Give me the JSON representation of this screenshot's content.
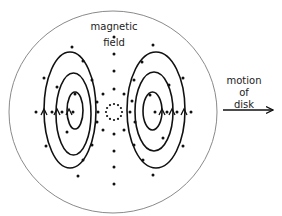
{
  "diagram": {
    "labels": {
      "field_line1": "magnetic",
      "field_line2": "field",
      "motion_line1": "motion",
      "motion_line2": "of",
      "motion_line3": "disk"
    },
    "colors": {
      "disk_outline": "#8a8a8a",
      "loops": "#111111",
      "dots": "#111111",
      "text": "#222222",
      "background": "#ffffff"
    },
    "disk": {
      "cx": 113,
      "cy": 112,
      "rx": 104,
      "ry": 101
    },
    "center_dotted_circle": {
      "cx": 114,
      "cy": 112,
      "r": 8,
      "dot_count": 12
    },
    "eddy_current_loops": {
      "left": [
        {
          "name": "outer",
          "x1": 44,
          "x2": 96,
          "y1": 52,
          "y2": 168
        },
        {
          "name": "middle",
          "x1": 56,
          "x2": 91,
          "y1": 73,
          "y2": 155
        },
        {
          "name": "inner",
          "x1": 67,
          "x2": 83,
          "y1": 92,
          "y2": 129
        }
      ],
      "right": [
        {
          "name": "outer",
          "x1": 127,
          "x2": 185,
          "y1": 52,
          "y2": 168
        },
        {
          "name": "middle",
          "x1": 135,
          "x2": 173,
          "y1": 72,
          "y2": 151
        },
        {
          "name": "inner",
          "x1": 143,
          "x2": 162,
          "y1": 92,
          "y2": 130
        }
      ]
    },
    "arrows": {
      "left_loop_arrows": [
        44,
        57,
        69
      ],
      "right_loop_arrows": [
        162,
        172,
        184
      ],
      "arrow_y": 112,
      "direction": "up"
    },
    "motion_arrow": {
      "x1": 223,
      "x2": 273,
      "y": 110,
      "direction": "right"
    },
    "field_dots": [
      [
        114,
        37
      ],
      [
        114,
        54
      ],
      [
        114,
        71
      ],
      [
        114,
        89
      ],
      [
        114,
        134
      ],
      [
        114,
        151
      ],
      [
        114,
        167
      ],
      [
        114,
        184
      ],
      [
        72,
        47
      ],
      [
        83,
        61
      ],
      [
        44,
        78
      ],
      [
        57,
        87
      ],
      [
        92,
        80
      ],
      [
        75,
        94
      ],
      [
        103,
        94
      ],
      [
        97,
        102
      ],
      [
        36,
        112
      ],
      [
        52,
        112
      ],
      [
        62,
        112
      ],
      [
        73,
        112
      ],
      [
        98,
        112
      ],
      [
        97,
        122
      ],
      [
        103,
        130
      ],
      [
        67,
        132
      ],
      [
        46,
        146
      ],
      [
        92,
        145
      ],
      [
        83,
        160
      ],
      [
        78,
        176
      ],
      [
        153,
        45
      ],
      [
        142,
        62
      ],
      [
        183,
        78
      ],
      [
        169,
        85
      ],
      [
        134,
        80
      ],
      [
        150,
        95
      ],
      [
        124,
        94
      ],
      [
        132,
        101
      ],
      [
        130,
        112
      ],
      [
        155,
        112
      ],
      [
        167,
        112
      ],
      [
        177,
        112
      ],
      [
        191,
        112
      ],
      [
        135,
        122
      ],
      [
        124,
        130
      ],
      [
        163,
        138
      ],
      [
        183,
        146
      ],
      [
        134,
        145
      ],
      [
        143,
        160
      ],
      [
        153,
        175
      ]
    ]
  }
}
